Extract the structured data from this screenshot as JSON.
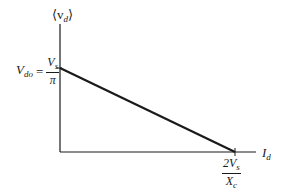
{
  "diagram": {
    "type": "line-characteristic",
    "y_axis": {
      "label": "⟨v",
      "label_sub": "d",
      "label_close": "⟩"
    },
    "x_axis": {
      "label": "I",
      "label_sub": "d"
    },
    "y_intercept": {
      "lhs": "V",
      "lhs_sub": "do",
      "equals": "=",
      "numerator": "V",
      "numerator_sub": "s",
      "denominator": "π"
    },
    "x_intercept": {
      "numerator": "2V",
      "numerator_sub": "s",
      "denominator": "X",
      "denominator_sub": "c"
    },
    "line": {
      "from": [
        0,
        "V_s/π"
      ],
      "to": [
        "2V_s/X_c",
        0
      ],
      "description": "linearly decreasing average output voltage vs load current"
    },
    "colors": {
      "axes": "#1a1a1a",
      "line": "#1a1a1a",
      "background": "#ffffff"
    }
  }
}
